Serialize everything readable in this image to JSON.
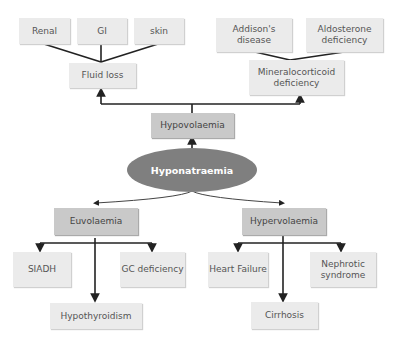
{
  "diagram": {
    "title": "Hyponatraemia",
    "center": "Hyponatraemia",
    "hypovolaemia": {
      "label": "Hypovolaemia",
      "fluid_loss": {
        "label": "Fluid loss",
        "causes": [
          "Renal",
          "GI",
          "skin"
        ]
      },
      "mineralocorticoid": {
        "label": "Mineralocorticoid deficiency",
        "causes": [
          "Addison's disease",
          "Aldosterone deficiency"
        ]
      }
    },
    "euvolaemia": {
      "label": "Euvolaemia",
      "causes": [
        "SIADH",
        "Hypothyroidism",
        "GC deficiency"
      ]
    },
    "hypervolaemia": {
      "label": "Hypervolaemia",
      "causes": [
        "Heart Failure",
        "Cirrhosis",
        "Nephrotic syndrome"
      ]
    },
    "colors": {
      "center_fill": "#7f7f7f",
      "mid_fill": "#c9c9c9",
      "light_fill": "#ebebeb",
      "line": "#222222"
    }
  }
}
